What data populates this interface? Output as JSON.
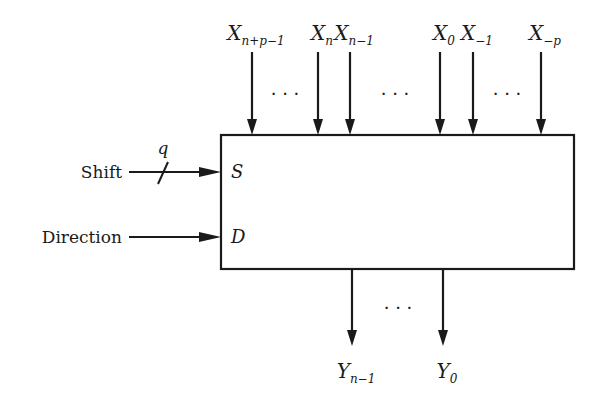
{
  "diagram": {
    "title": "",
    "stroke_color": "#1a1a1a",
    "background": "#ffffff",
    "block": {
      "x": 221,
      "y": 135,
      "width": 353,
      "height": 134
    },
    "inputs_top": [
      {
        "id": "x-n-plus-p-minus-1",
        "base": "X",
        "sub": "n+p−1",
        "x": 252
      },
      {
        "id": "x-n",
        "base": "X",
        "sub": "n",
        "x": 318
      },
      {
        "id": "x-n-minus-1",
        "base": "X",
        "sub": "n−1",
        "x": 350
      },
      {
        "id": "x-0",
        "base": "X",
        "sub": "0",
        "x": 440
      },
      {
        "id": "x-minus-1",
        "base": "X",
        "sub": "−1",
        "x": 473
      },
      {
        "id": "x-minus-p",
        "base": "X",
        "sub": "−p",
        "x": 541
      }
    ],
    "top_ellipses": [
      {
        "x": 285,
        "text": "· · ·"
      },
      {
        "x": 395,
        "text": "· · ·"
      },
      {
        "x": 507,
        "text": "· · ·"
      }
    ],
    "inputs_left": [
      {
        "id": "shift",
        "label": "Shift",
        "port": "S",
        "bus_width": "q",
        "y": 172
      },
      {
        "id": "direction",
        "label": "Direction",
        "port": "D",
        "y": 237
      }
    ],
    "outputs_bottom": [
      {
        "id": "y-n-minus-1",
        "base": "Y",
        "sub": "n−1",
        "x": 352
      },
      {
        "id": "y-0",
        "base": "Y",
        "sub": "0",
        "x": 443
      }
    ],
    "bottom_ellipsis": {
      "x": 398,
      "text": "· · ·"
    }
  }
}
